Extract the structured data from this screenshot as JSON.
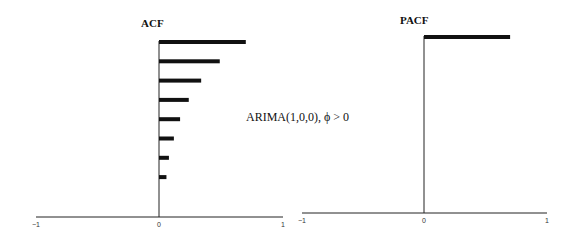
{
  "chart_data": [
    {
      "type": "bar",
      "orientation": "horizontal",
      "title": "ACF",
      "xlabel": "",
      "ylabel": "",
      "xlim": [
        -1,
        1
      ],
      "x_ticks": [
        "−1",
        "0",
        "1"
      ],
      "grid": false,
      "categories": [
        "lag 1",
        "lag 2",
        "lag 3",
        "lag 4",
        "lag 5",
        "lag 6",
        "lag 7",
        "lag 8"
      ],
      "values": [
        0.7,
        0.49,
        0.34,
        0.24,
        0.17,
        0.12,
        0.08,
        0.06
      ]
    },
    {
      "type": "bar",
      "orientation": "horizontal",
      "title": "PACF",
      "xlabel": "",
      "ylabel": "",
      "xlim": [
        -1,
        1
      ],
      "x_ticks": [
        "−1",
        "0",
        "1"
      ],
      "grid": false,
      "categories": [
        "lag 1"
      ],
      "values": [
        0.7
      ]
    }
  ],
  "annotation": "ARIMA(1,0,0), ϕ > 0",
  "panels": {
    "acf": {
      "title": "ACF",
      "ticks": {
        "neg": "−1",
        "zero": "0",
        "pos": "1"
      }
    },
    "pacf": {
      "title": "PACF",
      "ticks": {
        "neg": "−1",
        "zero": "0",
        "pos": "1"
      }
    }
  },
  "colors": {
    "bar": "#111111",
    "axis": "#222222",
    "background": "#ffffff"
  }
}
